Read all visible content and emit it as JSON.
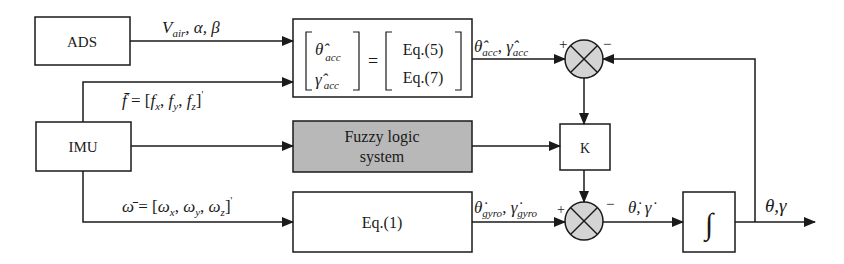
{
  "diagram": {
    "type": "block-diagram",
    "blocks": {
      "ads": {
        "label": "ADS"
      },
      "imu": {
        "label": "IMU"
      },
      "acc_eq": {
        "lhs_top": "θ̂",
        "lhs_top_sub": "acc",
        "lhs_bottom": "γ̂",
        "lhs_bottom_sub": "acc",
        "equals": "=",
        "rhs_top": "Eq.(5)",
        "rhs_bottom": "Eq.(7)"
      },
      "fuzzy": {
        "line1": "Fuzzy logic",
        "line2": "system",
        "fill": "#b8b8b8"
      },
      "gain": {
        "label": "K"
      },
      "gyro_eq": {
        "label": "Eq.(1)"
      },
      "integrator": {
        "label": "∫"
      }
    },
    "summing_junctions": {
      "sum1": {
        "plus": "+",
        "minus": "−",
        "fill": "#d4d4d4"
      },
      "sum2": {
        "plus": "+",
        "minus": "−",
        "fill": "#d4d4d4"
      }
    },
    "signals": {
      "ads_out": {
        "v": "V",
        "v_sub": "air",
        "rest": ", α, β"
      },
      "f_vec": {
        "lhs": "f̄",
        "eq": " = [",
        "fx": "f",
        "fx_sub": "x",
        "fy": "f",
        "fy_sub": "y",
        "fz": "f",
        "fz_sub": "z",
        "close": "]",
        "prime": "'"
      },
      "omega_vec": {
        "lhs": "ω̄",
        "eq": " = [",
        "wx": "ω",
        "wx_sub": "x",
        "wy": "ω",
        "wy_sub": "y",
        "wz": "ω",
        "wz_sub": "z",
        "close": "]",
        "prime": "'"
      },
      "acc_out": {
        "theta": "θ̂",
        "theta_sub": "acc",
        "sep": ", ",
        "gamma": "γ̂",
        "gamma_sub": "acc"
      },
      "gyro_out": {
        "theta": "θ̇",
        "theta_sub": "gyro",
        "sep": ", ",
        "gamma": "γ̇",
        "gamma_sub": "gyro"
      },
      "rate": {
        "text": "θ̇, γ̇"
      },
      "output": {
        "text": "θ,γ"
      }
    }
  }
}
